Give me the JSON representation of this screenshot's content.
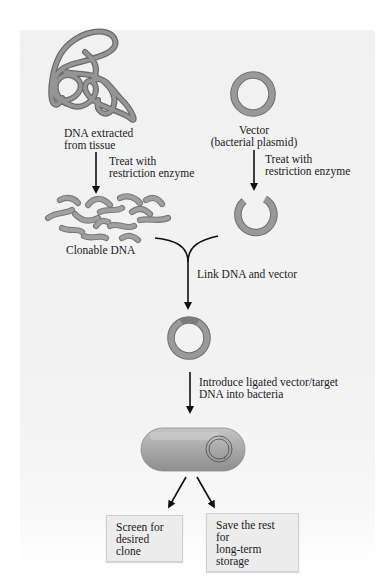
{
  "diagram": {
    "colors": {
      "panel_bg": "#f1f1f1",
      "dna_strand": "#8f8f8f",
      "dna_outline": "#6a6a6a",
      "arrow": "#111111",
      "bacterium": "#a9a9a9"
    },
    "nodes": {
      "tissue_dna": {
        "line1": "DNA extracted",
        "line2": "from tissue"
      },
      "vector": {
        "line1": "Vector",
        "line2": "(bacterial plasmid)"
      },
      "clonable_dna": {
        "label": "Clonable DNA"
      },
      "recombinant_plasmid": {
        "label": ""
      },
      "bacterium": {
        "label": ""
      }
    },
    "steps": {
      "treat_left": {
        "line1": "Treat with",
        "line2": "restriction enzyme"
      },
      "treat_right": {
        "line1": "Treat with",
        "line2": "restriction enzyme"
      },
      "link": {
        "label": "Link DNA and vector"
      },
      "introduce": {
        "line1": "Introduce ligated vector/target",
        "line2": "DNA into bacteria"
      }
    },
    "outcomes": [
      {
        "line1": "Screen for",
        "line2": "desired clone"
      },
      {
        "line1": "Save the rest for",
        "line2": "long-term storage"
      }
    ],
    "icons": {
      "tangled_dna": "tangled-dna-icon",
      "plasmid": "plasmid-ring-icon",
      "fragments": "dna-fragments-icon",
      "cut_plasmid": "cut-plasmid-icon",
      "bacterium": "bacterium-icon"
    }
  }
}
